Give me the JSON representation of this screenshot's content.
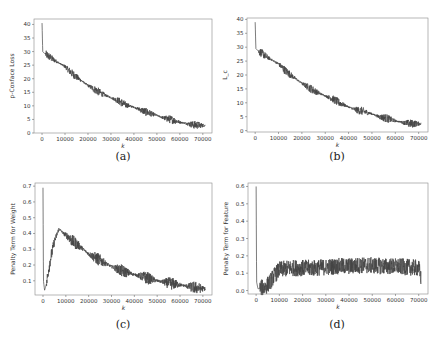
{
  "figure": {
    "captions": [
      "(a)",
      "(b)",
      "(c)",
      "(d)"
    ]
  },
  "chart_data": [
    {
      "type": "line",
      "panel": "(a)",
      "title": "",
      "xlabel": "k",
      "ylabel": "p-Coxface Loss",
      "xlim": [
        -3500,
        74000
      ],
      "ylim": [
        0,
        42
      ],
      "xticks": [
        0,
        10000,
        20000,
        30000,
        40000,
        50000,
        60000,
        70000
      ],
      "yticks": [
        0,
        5,
        10,
        15,
        20,
        25,
        30,
        35,
        40
      ],
      "grid": false,
      "color": "#444444",
      "x": [
        0,
        300,
        800,
        2000,
        5000,
        8000,
        10000,
        13000,
        16000,
        20000,
        23000,
        26000,
        30000,
        33000,
        36000,
        40000,
        43000,
        46000,
        50000,
        53000,
        56000,
        60000,
        63000,
        66000,
        70000,
        71000
      ],
      "values": [
        40.5,
        30,
        29.5,
        28.8,
        27,
        25.5,
        24.5,
        22,
        20,
        17.5,
        16,
        14.5,
        13,
        12,
        10.5,
        9.5,
        8.5,
        7.5,
        6.5,
        5.5,
        5,
        4,
        3.5,
        3,
        2.8,
        2.8
      ],
      "noise_amplitude": 1.5
    },
    {
      "type": "line",
      "panel": "(b)",
      "title": "",
      "xlabel": "k",
      "ylabel": "L_c",
      "xlim": [
        -3500,
        74000
      ],
      "ylim": [
        -0.5,
        40.5
      ],
      "xticks": [
        0,
        10000,
        20000,
        30000,
        40000,
        50000,
        60000,
        70000
      ],
      "yticks": [
        0,
        5,
        10,
        15,
        20,
        25,
        30,
        35,
        40
      ],
      "grid": false,
      "color": "#444444",
      "x": [
        0,
        300,
        800,
        2000,
        5000,
        8000,
        10000,
        13000,
        16000,
        20000,
        23000,
        26000,
        30000,
        33000,
        36000,
        40000,
        43000,
        46000,
        50000,
        53000,
        56000,
        60000,
        63000,
        66000,
        70000,
        71000
      ],
      "values": [
        39,
        29.5,
        29,
        28.3,
        26.5,
        25,
        24,
        21.5,
        19.5,
        17,
        15.5,
        14,
        12.5,
        11.5,
        10,
        8.5,
        7.5,
        7,
        6,
        5,
        4.5,
        3.5,
        3,
        2.5,
        2.5,
        2.5
      ],
      "noise_amplitude": 1.5
    },
    {
      "type": "line",
      "panel": "(c)",
      "title": "",
      "xlabel": "k",
      "ylabel": "Penalty Term for Weight",
      "xlim": [
        -3500,
        74000
      ],
      "ylim": [
        0.01,
        0.72
      ],
      "xticks": [
        0,
        10000,
        20000,
        30000,
        40000,
        50000,
        60000,
        70000
      ],
      "yticks": [
        0.1,
        0.2,
        0.3,
        0.4,
        0.5,
        0.6,
        0.7
      ],
      "grid": false,
      "color": "#444444",
      "x": [
        0,
        200,
        700,
        1500,
        3000,
        5000,
        7000,
        9000,
        11000,
        13000,
        16000,
        20000,
        25000,
        30000,
        35000,
        40000,
        45000,
        50000,
        55000,
        60000,
        65000,
        70000,
        71000
      ],
      "values": [
        0.69,
        0.1,
        0.04,
        0.08,
        0.22,
        0.35,
        0.43,
        0.4,
        0.38,
        0.35,
        0.32,
        0.27,
        0.23,
        0.19,
        0.16,
        0.14,
        0.12,
        0.1,
        0.085,
        0.075,
        0.06,
        0.05,
        0.05
      ],
      "noise_amplitude": 0.04
    },
    {
      "type": "line",
      "panel": "(d)",
      "title": "",
      "xlabel": "k",
      "ylabel": "Penalty Term for Feature",
      "xlim": [
        -3500,
        74000
      ],
      "ylim": [
        -0.02,
        0.62
      ],
      "xticks": [
        0,
        10000,
        20000,
        30000,
        40000,
        50000,
        60000,
        70000
      ],
      "yticks": [
        0.0,
        0.1,
        0.2,
        0.3,
        0.4,
        0.5,
        0.6
      ],
      "grid": false,
      "color": "#444444",
      "x": [
        0,
        200,
        800,
        2000,
        4000,
        6000,
        8000,
        10000,
        15000,
        20000,
        25000,
        30000,
        35000,
        40000,
        45000,
        50000,
        55000,
        60000,
        65000,
        70000,
        71000
      ],
      "values": [
        0.6,
        0.05,
        0.01,
        0.015,
        0.02,
        0.05,
        0.09,
        0.12,
        0.13,
        0.13,
        0.13,
        0.135,
        0.14,
        0.14,
        0.145,
        0.145,
        0.14,
        0.14,
        0.135,
        0.13,
        0.07
      ],
      "noise_amplitude": 0.04
    }
  ]
}
